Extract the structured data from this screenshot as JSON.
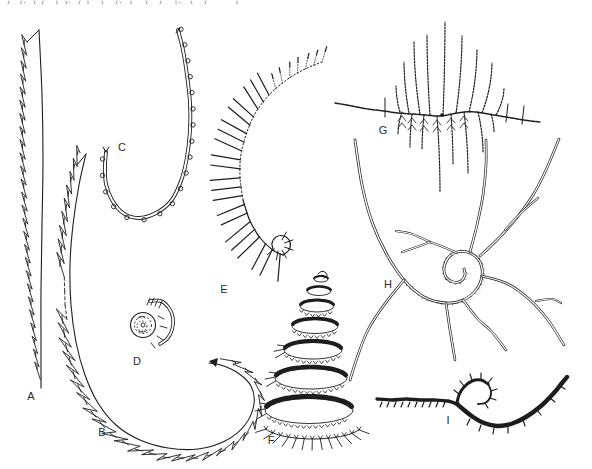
{
  "colors": {
    "background": "#ffffff",
    "ink": "#1d1d1d",
    "faint_fragment": "#8f8f8f",
    "label": "#2a2a2a"
  },
  "labels": [
    "A",
    "B",
    "C",
    "D",
    "E",
    "F",
    "G",
    "H",
    "I"
  ]
}
